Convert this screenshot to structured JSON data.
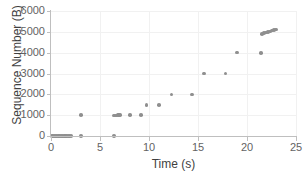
{
  "chart_data": {
    "type": "scatter",
    "title": "",
    "xlabel": "Time (s)",
    "ylabel": "Sequence Number (B)",
    "xlim": [
      0,
      25
    ],
    "ylim": [
      0,
      6000
    ],
    "xticks": [
      0,
      5,
      10,
      15,
      20,
      25
    ],
    "yticks": [
      0,
      1000,
      2000,
      3000,
      4000,
      5000,
      6000
    ],
    "grid": true,
    "legend": "none",
    "marker_color": "#8f8f8f",
    "series": [
      {
        "name": "Sequence Number",
        "points": [
          [
            0.1,
            0
          ],
          [
            0.22,
            0
          ],
          [
            0.34,
            0
          ],
          [
            0.46,
            0
          ],
          [
            0.58,
            0
          ],
          [
            0.7,
            0
          ],
          [
            0.82,
            0
          ],
          [
            0.94,
            0
          ],
          [
            1.06,
            0
          ],
          [
            1.18,
            0
          ],
          [
            1.3,
            0
          ],
          [
            1.42,
            0
          ],
          [
            1.54,
            0
          ],
          [
            1.66,
            0
          ],
          [
            1.78,
            0
          ],
          [
            1.9,
            0
          ],
          [
            2.02,
            0
          ],
          [
            3.05,
            0
          ],
          [
            3.05,
            1000
          ],
          [
            6.4,
            0
          ],
          [
            6.45,
            980
          ],
          [
            6.57,
            985
          ],
          [
            6.69,
            990
          ],
          [
            6.81,
            995
          ],
          [
            6.93,
            1000
          ],
          [
            7.05,
            1005
          ],
          [
            8.05,
            1020
          ],
          [
            9.2,
            1020
          ],
          [
            9.75,
            1500
          ],
          [
            11.0,
            1500
          ],
          [
            12.3,
            2000
          ],
          [
            14.4,
            2000
          ],
          [
            15.6,
            3000
          ],
          [
            17.8,
            3000
          ],
          [
            19.0,
            4000
          ],
          [
            21.4,
            3980
          ],
          [
            21.55,
            4900
          ],
          [
            21.75,
            4930
          ],
          [
            21.95,
            4960
          ],
          [
            22.15,
            4990
          ],
          [
            22.35,
            5020
          ],
          [
            22.55,
            5060
          ],
          [
            22.75,
            5090
          ],
          [
            22.95,
            5120
          ]
        ]
      }
    ]
  }
}
